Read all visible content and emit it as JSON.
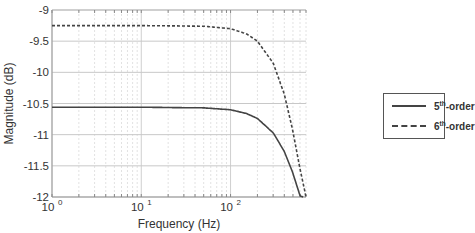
{
  "chart_data": {
    "type": "line",
    "title": "",
    "xlabel": "Frequency (Hz)",
    "ylabel": "Magnitude (dB)",
    "xscale": "log",
    "xlim": [
      1,
      700
    ],
    "ylim": [
      -12,
      -9
    ],
    "x_ticks": [
      {
        "value": 1,
        "base": "10",
        "exp": "0"
      },
      {
        "value": 10,
        "base": "10",
        "exp": "1"
      },
      {
        "value": 100,
        "base": "10",
        "exp": "2"
      }
    ],
    "y_ticks": [
      -9,
      -9.5,
      -10,
      -10.5,
      -11,
      -11.5,
      -12
    ],
    "y_tick_labels": [
      "-9",
      "-9.5",
      "-10",
      "-10.5",
      "-11",
      "-11.5",
      "-12"
    ],
    "grid": true,
    "legend_position": "right-outside",
    "series": [
      {
        "name": "5th-order",
        "legend_base": "5",
        "legend_sup": "th",
        "legend_rest": "-order",
        "style": "solid",
        "x": [
          1,
          10,
          50,
          100,
          150,
          200,
          300,
          400,
          500,
          600,
          650
        ],
        "values": [
          -10.56,
          -10.56,
          -10.57,
          -10.6,
          -10.66,
          -10.74,
          -10.97,
          -11.27,
          -11.62,
          -11.98,
          -12.0
        ]
      },
      {
        "name": "6th-order",
        "legend_base": "6",
        "legend_sup": "th",
        "legend_rest": "-order",
        "style": "dashed",
        "x": [
          1,
          10,
          50,
          100,
          150,
          200,
          300,
          400,
          500,
          600,
          700
        ],
        "values": [
          -9.25,
          -9.25,
          -9.26,
          -9.3,
          -9.38,
          -9.5,
          -9.85,
          -10.35,
          -10.95,
          -11.55,
          -12.0
        ]
      }
    ],
    "colors": {
      "line": "#444444",
      "grid": "#d0d0d0",
      "axis": "#888888",
      "text": "#333333"
    }
  }
}
